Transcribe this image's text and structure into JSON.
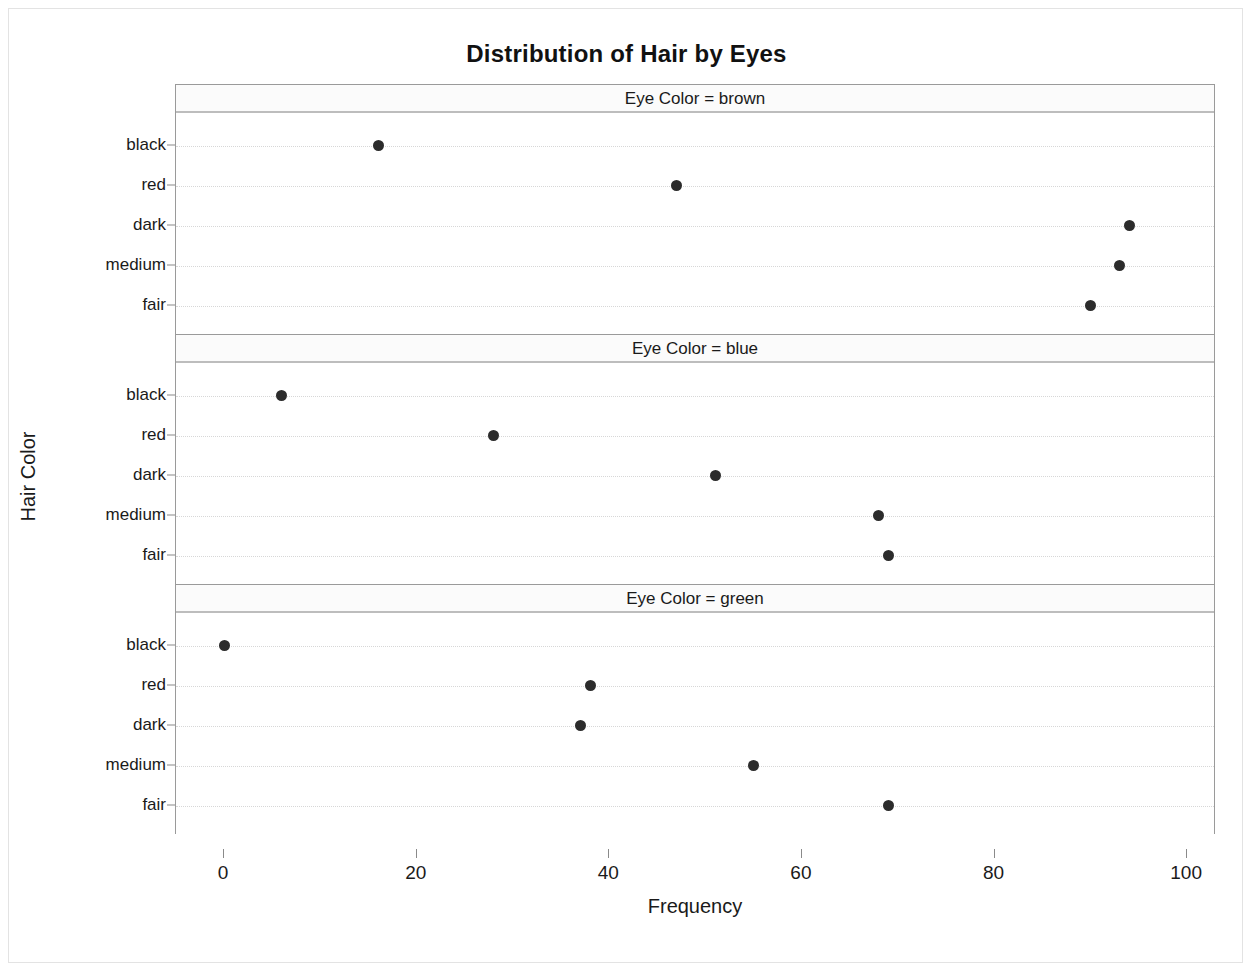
{
  "chart_data": {
    "type": "scatter",
    "title": "Distribution of Hair by Eyes",
    "xlabel": "Frequency",
    "ylabel": "Hair Color",
    "xlim": [
      -5,
      103
    ],
    "xticks": [
      0,
      20,
      40,
      60,
      80,
      100
    ],
    "categories": [
      "black",
      "red",
      "dark",
      "medium",
      "fair"
    ],
    "grid": "dotted-horizontal",
    "legend": "none",
    "panel_var": "Eye Color",
    "panels": [
      {
        "header": "Eye Color = brown",
        "eye_color": "brown",
        "points": [
          {
            "hair": "black",
            "frequency": 16
          },
          {
            "hair": "red",
            "frequency": 47
          },
          {
            "hair": "dark",
            "frequency": 94
          },
          {
            "hair": "medium",
            "frequency": 93
          },
          {
            "hair": "fair",
            "frequency": 90
          }
        ]
      },
      {
        "header": "Eye Color = blue",
        "eye_color": "blue",
        "points": [
          {
            "hair": "black",
            "frequency": 6
          },
          {
            "hair": "red",
            "frequency": 28
          },
          {
            "hair": "dark",
            "frequency": 51
          },
          {
            "hair": "medium",
            "frequency": 68
          },
          {
            "hair": "fair",
            "frequency": 69
          }
        ]
      },
      {
        "header": "Eye Color = green",
        "eye_color": "green",
        "points": [
          {
            "hair": "black",
            "frequency": 0
          },
          {
            "hair": "red",
            "frequency": 38
          },
          {
            "hair": "dark",
            "frequency": 37
          },
          {
            "hair": "medium",
            "frequency": 55
          },
          {
            "hair": "fair",
            "frequency": 69
          }
        ]
      }
    ],
    "colors": {
      "marker": "#2c2c2c",
      "panel_border": "#9a9a9a",
      "grid": "#d7d7d7",
      "text": "#1a1a1a",
      "background": "#ffffff"
    }
  }
}
